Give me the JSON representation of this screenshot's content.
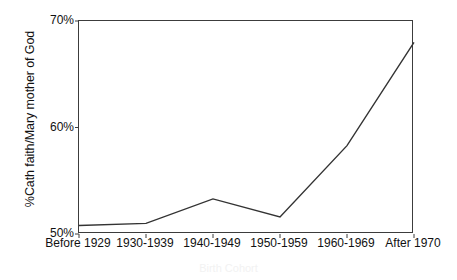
{
  "chart_data": {
    "type": "line",
    "title": "",
    "xlabel": "Birth Cohort",
    "ylabel": "%Cath faith/Mary mother of God",
    "categories": [
      "Before 1929",
      "1930-1939",
      "1940-1949",
      "1950-1959",
      "1960-1969",
      "After 1970"
    ],
    "values": [
      50.8,
      51.0,
      53.3,
      51.6,
      58.3,
      68.0
    ],
    "series": [
      {
        "name": "%Cath faith/Mary mother of God",
        "values": [
          50.8,
          51.0,
          53.3,
          51.6,
          58.3,
          68.0
        ]
      }
    ],
    "ylim": [
      50,
      70
    ],
    "ytick_labels": [
      "50%",
      "60%",
      "70%"
    ],
    "ytick_values": [
      50,
      60,
      70
    ],
    "grid": false,
    "legend": false,
    "line_color": "#333333",
    "frame_color": "#3c3c3c",
    "background_color": "#ffffff"
  }
}
